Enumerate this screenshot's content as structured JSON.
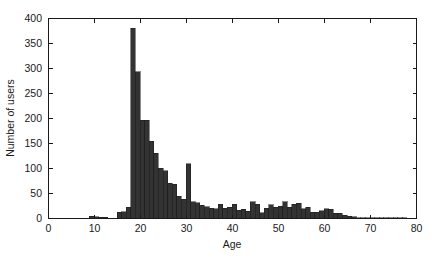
{
  "chart_data": {
    "type": "bar",
    "title": "",
    "subtitle": "",
    "xlabel": "Age",
    "ylabel": "Number of users",
    "xlim": [
      0,
      80
    ],
    "ylim": [
      0,
      400
    ],
    "grid": false,
    "legend_position": "none",
    "bar_color": "#333333",
    "bar_edge_color": "#1a1a1a",
    "bar_width_years": 1,
    "xticks": [
      0,
      10,
      20,
      30,
      40,
      50,
      60,
      70,
      80
    ],
    "xticklabels": [
      "0",
      "10",
      "20",
      "30",
      "40",
      "50",
      "60",
      "70",
      "80"
    ],
    "yticks": [
      0,
      50,
      100,
      150,
      200,
      250,
      300,
      350,
      400
    ],
    "yticklabels": [
      "0",
      "50",
      "100",
      "150",
      "200",
      "250",
      "300",
      "350",
      "400"
    ],
    "xminor_ticks": [
      5,
      15,
      25,
      35,
      45,
      55,
      65,
      75
    ],
    "categories": [
      8,
      9,
      10,
      11,
      12,
      13,
      14,
      15,
      16,
      17,
      18,
      19,
      20,
      21,
      22,
      23,
      24,
      25,
      26,
      27,
      28,
      29,
      30,
      31,
      32,
      33,
      34,
      35,
      36,
      37,
      38,
      39,
      40,
      41,
      42,
      43,
      44,
      45,
      46,
      47,
      48,
      49,
      50,
      51,
      52,
      53,
      54,
      55,
      56,
      57,
      58,
      59,
      60,
      61,
      62,
      63,
      64,
      65,
      66,
      67,
      68,
      69,
      70,
      71,
      72,
      73,
      74,
      75,
      76,
      77,
      78,
      79
    ],
    "values": [
      0,
      4,
      3,
      2,
      2,
      0,
      0,
      12,
      13,
      22,
      380,
      293,
      196,
      196,
      154,
      130,
      100,
      95,
      70,
      68,
      44,
      38,
      109,
      33,
      31,
      26,
      23,
      20,
      19,
      28,
      20,
      22,
      28,
      16,
      18,
      14,
      33,
      28,
      11,
      20,
      27,
      22,
      24,
      33,
      22,
      28,
      30,
      19,
      22,
      12,
      12,
      15,
      19,
      18,
      10,
      10,
      6,
      4,
      3,
      1,
      1,
      1,
      1,
      1,
      1,
      1,
      1,
      1,
      1,
      1,
      0,
      0
    ],
    "annotations": []
  },
  "figure": {
    "background_color": "#ffffff",
    "axes_color": "#1a1a1a"
  }
}
